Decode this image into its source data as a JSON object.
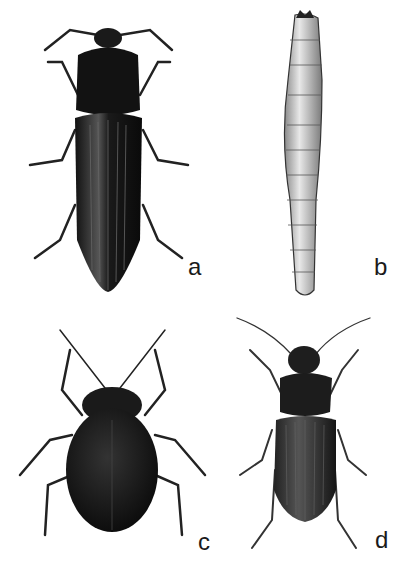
{
  "figure": {
    "panels": [
      {
        "id": "a",
        "label": "a",
        "subject": "click beetle (elongated adult, dorsal view)"
      },
      {
        "id": "b",
        "label": "b",
        "subject": "wireworm larva (dorsal view)"
      },
      {
        "id": "c",
        "label": "c",
        "subject": "leaf beetle (rounded adult, dorsal view)"
      },
      {
        "id": "d",
        "label": "d",
        "subject": "ground beetle (adult, dorsal view)"
      }
    ],
    "colors": {
      "background": "#ffffff",
      "ink": "#111111",
      "larva": "#d8d8d8"
    }
  }
}
